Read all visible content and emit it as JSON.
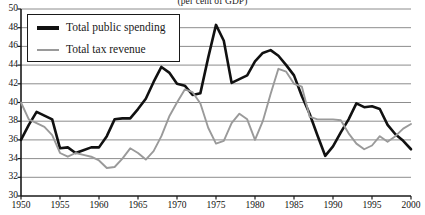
{
  "chart_data": {
    "type": "line",
    "title": "(per cent of GDP)",
    "xlabel": "",
    "ylabel": "",
    "xlim": [
      1950,
      2000
    ],
    "ylim": [
      30,
      50
    ],
    "yticks": [
      30,
      32,
      34,
      36,
      38,
      40,
      42,
      44,
      46,
      48,
      50
    ],
    "xticks": [
      1950,
      1955,
      1960,
      1965,
      1970,
      1975,
      1980,
      1985,
      1990,
      1995,
      2000
    ],
    "grid": "horizontal",
    "legend_position": "top-left",
    "colors": {
      "total_public_spending": "#111111",
      "total_tax_revenue": "#9a9a9a",
      "gridline": "#808080",
      "axis": "#1a1a1a",
      "background": "#ffffff"
    },
    "x": [
      1950,
      1951,
      1952,
      1953,
      1954,
      1955,
      1956,
      1957,
      1958,
      1959,
      1960,
      1961,
      1962,
      1963,
      1964,
      1965,
      1966,
      1967,
      1968,
      1969,
      1970,
      1971,
      1972,
      1973,
      1974,
      1975,
      1976,
      1977,
      1978,
      1979,
      1980,
      1981,
      1982,
      1983,
      1984,
      1985,
      1986,
      1987,
      1988,
      1989,
      1990,
      1991,
      1992,
      1993,
      1994,
      1995,
      1996,
      1997,
      1998,
      1999,
      2000
    ],
    "series": [
      {
        "name": "Total public spending",
        "color": "#111111",
        "values": [
          36.0,
          37.6,
          39.0,
          38.6,
          38.2,
          35.1,
          35.2,
          34.6,
          34.9,
          35.2,
          35.2,
          36.4,
          38.2,
          38.3,
          38.3,
          39.3,
          40.4,
          42.2,
          43.8,
          43.2,
          42.0,
          41.8,
          40.8,
          41.0,
          44.8,
          48.3,
          46.6,
          42.1,
          42.5,
          42.9,
          44.4,
          45.3,
          45.6,
          45.0,
          44.0,
          42.9,
          40.7,
          38.8,
          36.5,
          34.3,
          35.3,
          36.8,
          38.2,
          39.9,
          39.5,
          39.6,
          39.3,
          37.6,
          36.6,
          35.9,
          35.0
        ]
      },
      {
        "name": "Total tax revenue",
        "color": "#9a9a9a",
        "values": [
          40.0,
          38.2,
          37.8,
          37.4,
          36.5,
          34.6,
          34.2,
          34.6,
          34.4,
          34.2,
          33.8,
          33.0,
          33.1,
          34.0,
          35.1,
          34.6,
          33.9,
          34.8,
          36.4,
          38.5,
          40.0,
          41.4,
          41.1,
          39.9,
          37.3,
          35.6,
          35.9,
          37.8,
          38.8,
          38.2,
          36.0,
          38.0,
          40.9,
          43.6,
          43.3,
          42.0,
          41.7,
          38.5,
          38.2,
          38.2,
          38.2,
          38.1,
          36.7,
          35.6,
          35.0,
          35.4,
          36.4,
          35.8,
          36.4,
          37.2,
          37.7
        ]
      }
    ]
  },
  "legend": {
    "items": [
      {
        "label": "Total public spending"
      },
      {
        "label": "Total tax revenue"
      }
    ]
  }
}
